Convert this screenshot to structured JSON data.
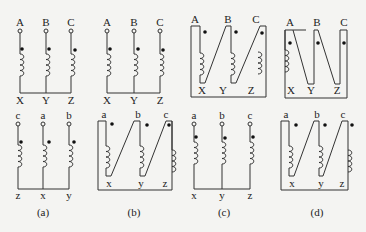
{
  "figure": {
    "panels": [
      {
        "id": "a",
        "caption": "(a)",
        "primary": {
          "connection": "star",
          "terminals": [
            "A",
            "B",
            "C"
          ],
          "ends": [
            "X",
            "Y",
            "Z"
          ]
        },
        "secondary": {
          "connection": "star",
          "terminals": [
            "c",
            "a",
            "b"
          ],
          "ends": [
            "z",
            "x",
            "y"
          ]
        }
      },
      {
        "id": "b",
        "caption": "(b)",
        "primary": {
          "connection": "star",
          "terminals": [
            "A",
            "B",
            "C"
          ],
          "ends": [
            "X",
            "Y",
            "Z"
          ]
        },
        "secondary": {
          "connection": "delta",
          "terminals": [
            "a",
            "b",
            "c"
          ],
          "ends": [
            "x",
            "y",
            "z"
          ]
        }
      },
      {
        "id": "c",
        "caption": "(c)",
        "primary": {
          "connection": "delta",
          "terminals": [
            "A",
            "B",
            "C"
          ],
          "ends": [
            "X",
            "Y",
            "Z"
          ]
        },
        "secondary": {
          "connection": "star",
          "terminals": [
            "a",
            "b",
            "c"
          ],
          "ends": [
            "x",
            "y",
            "z"
          ]
        }
      },
      {
        "id": "d",
        "caption": "(d)",
        "primary": {
          "connection": "delta-reversed",
          "terminals": [
            "A",
            "B",
            "C"
          ],
          "ends": [
            "X",
            "Y",
            "Z"
          ]
        },
        "secondary": {
          "connection": "delta",
          "terminals": [
            "a",
            "b",
            "c"
          ],
          "ends": [
            "x",
            "y",
            "z"
          ]
        }
      }
    ],
    "colors": {
      "background": "#f4f4f2",
      "line": "#333333",
      "dot": "#111111"
    }
  }
}
